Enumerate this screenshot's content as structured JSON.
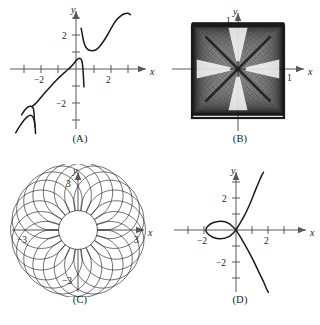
{
  "figure": {
    "background": "#ffffff",
    "ink": "#1a1a1a",
    "axis_color": "#59595b",
    "curve_color": "#1a1a1a",
    "panel_count": 4
  },
  "panels": [
    {
      "key": "A",
      "caption": "(A)",
      "axis_x_label": "x",
      "axis_y_label": "y",
      "x_tick_labels": [
        "−2",
        "2"
      ],
      "y_tick_labels": [
        "2",
        "−2"
      ],
      "chart_data": {
        "type": "line",
        "title": "",
        "subtitle": "",
        "xlabel": "x",
        "ylabel": "y",
        "xlim": [
          -3.6,
          3.4
        ],
        "ylim": [
          -3.8,
          3.4
        ],
        "x_ticks": [
          -3,
          -2,
          -1,
          1,
          2,
          3
        ],
        "y_ticks": [
          -3,
          -2,
          -1,
          1,
          2,
          3
        ],
        "x_tick_labels": {
          "-2": "−2",
          "2": "2"
        },
        "y_tick_labels": {
          "2": "2",
          "-2": "−2"
        },
        "grid": false,
        "legend": "none",
        "annotations": [
          "increasing wave-like curve with two near-vertical jump discontinuities",
          "discontinuity near x = -2.4 on the lower-left branch",
          "discontinuity near x = 0.4 spanning y from about -1 up to about 2.4"
        ],
        "series": [
          {
            "name": "branch-1-lower-left",
            "comment": "leftmost rising segment ending in a steep downward spike near x = -2.4",
            "points": [
              [
                -3.55,
                -3.75
              ],
              [
                -3.3,
                -3.35
              ],
              [
                -3.05,
                -3.0
              ],
              [
                -2.85,
                -2.8
              ],
              [
                -2.68,
                -2.72
              ],
              [
                -2.55,
                -2.8
              ],
              [
                -2.45,
                -3.05
              ],
              [
                -2.4,
                -3.45
              ],
              [
                -2.38,
                -3.8
              ]
            ]
          },
          {
            "name": "branch-2-rise-to-jump",
            "comment": "segment from the jump at x = -2.4 rising smoothly through the origin region to the jump at x = 0.4",
            "points": [
              [
                -2.42,
                -3.4
              ],
              [
                -2.45,
                -2.9
              ],
              [
                -2.48,
                -2.5
              ],
              [
                -2.52,
                -2.3
              ],
              [
                -2.62,
                -2.2
              ],
              [
                -2.8,
                -2.22
              ],
              [
                -3.0,
                -2.4
              ],
              [
                -3.2,
                -2.7
              ]
            ]
          },
          {
            "name": "branch-3-main-rise",
            "comment": "long S-shaped rise from lower-left through origin up to the discontinuity at x = 0.4",
            "points": [
              [
                -2.6,
                -2.22
              ],
              [
                -2.3,
                -1.95
              ],
              [
                -2.0,
                -1.6
              ],
              [
                -1.7,
                -1.25
              ],
              [
                -1.4,
                -0.92
              ],
              [
                -1.1,
                -0.6
              ],
              [
                -0.8,
                -0.32
              ],
              [
                -0.55,
                -0.1
              ],
              [
                -0.35,
                0.08
              ],
              [
                -0.15,
                0.3
              ],
              [
                0.0,
                0.48
              ],
              [
                0.12,
                0.6
              ],
              [
                0.25,
                0.62
              ],
              [
                0.34,
                0.5
              ],
              [
                0.4,
                0.1
              ],
              [
                0.44,
                -0.5
              ],
              [
                0.47,
                -1.05
              ]
            ]
          },
          {
            "name": "branch-4-upper-jump",
            "comment": "upper piece of the discontinuity at x = 0.4, falling from y≈2.4 then turning upward",
            "points": [
              [
                0.3,
                2.4
              ],
              [
                0.36,
                2.1
              ],
              [
                0.42,
                1.75
              ],
              [
                0.5,
                1.45
              ],
              [
                0.6,
                1.25
              ],
              [
                0.75,
                1.12
              ],
              [
                0.95,
                1.08
              ],
              [
                1.15,
                1.12
              ],
              [
                1.35,
                1.28
              ],
              [
                1.6,
                1.6
              ],
              [
                1.85,
                2.0
              ],
              [
                2.1,
                2.45
              ],
              [
                2.35,
                2.85
              ],
              [
                2.6,
                3.1
              ],
              [
                2.85,
                3.25
              ],
              [
                3.05,
                3.28
              ],
              [
                3.2,
                3.2
              ]
            ]
          }
        ]
      }
    },
    {
      "key": "B",
      "caption": "(B)",
      "axis_x_label": "x",
      "axis_y_label": "y",
      "x_tick_labels": [
        "1"
      ],
      "y_tick_labels": [
        "1"
      ],
      "chart_data": {
        "type": "line",
        "title": "",
        "subtitle": "",
        "xlabel": "x",
        "ylabel": "y",
        "xlim": [
          -1.45,
          1.45
        ],
        "ylim": [
          -1.45,
          1.45
        ],
        "x_ticks": [
          1
        ],
        "y_ticks": [
          1
        ],
        "x_tick_labels": {
          "1": "1"
        },
        "y_tick_labels": {
          "1": "1"
        },
        "grid": false,
        "legend": "none",
        "annotations": [
          "dense Lissajous-style curve filling a square region from -1 to 1 in both x and y",
          "four light bowtie-shaped voids radiating along the diagonals",
          "solid dark square border formed by the envelope of the curve"
        ],
        "series": [
          {
            "name": "lissajous-dense-mesh",
            "parametric": true,
            "x_expr": "sin(a*t)",
            "y_expr": "sin(b*t)",
            "a": 43,
            "b": 41,
            "t_range": [
              0,
              6.283185
            ],
            "samples": 2600
          }
        ]
      }
    },
    {
      "key": "C",
      "caption": "(C)",
      "axis_x_label": "x",
      "axis_y_label": "y",
      "x_tick_labels": [
        "−3",
        "3"
      ],
      "y_tick_labels": [
        "3",
        "−3"
      ],
      "chart_data": {
        "type": "line",
        "title": "",
        "subtitle": "",
        "xlabel": "x",
        "ylabel": "y",
        "xlim": [
          -4.1,
          4.1
        ],
        "ylim": [
          -4.1,
          4.1
        ],
        "x_ticks": [
          -3,
          3
        ],
        "y_ticks": [
          -3,
          3
        ],
        "x_tick_labels": {
          "-3": "−3",
          "3": "3"
        },
        "y_tick_labels": {
          "3": "3",
          "-3": "−3"
        },
        "grid": false,
        "legend": "none",
        "annotations": [
          "epitrochoid / rose-like annulus of overlapping circular petals",
          "about 22 overlapping loops arranged around an empty circular core",
          "outer radius reaches 3 on both axes"
        ],
        "series": [
          {
            "name": "epitrochoid-petals",
            "parametric": true,
            "x_expr": "(R+r)*cos(t) - d*cos((R+r)/r*t)",
            "y_expr": "(R+r)*sin(t) - d*sin((R+r)/r*t)",
            "R": 1.7,
            "r": 0.1,
            "d": 1.25,
            "petal_count": 22,
            "inner_hole_radius": 1.05,
            "outer_radius": 3.0,
            "t_range": [
              0,
              6.283185
            ],
            "samples": 2000
          }
        ]
      }
    },
    {
      "key": "D",
      "caption": "(D)",
      "axis_x_label": "x",
      "axis_y_label": "y",
      "x_tick_labels": [
        "−2",
        "2"
      ],
      "y_tick_labels": [
        "2",
        "−2"
      ],
      "chart_data": {
        "type": "line",
        "title": "",
        "subtitle": "",
        "xlabel": "x",
        "ylabel": "y",
        "xlim": [
          -3.3,
          3.6
        ],
        "ylim": [
          -3.9,
          3.6
        ],
        "x_ticks": [
          -3,
          -2,
          -1,
          1,
          2,
          3
        ],
        "y_ticks": [
          -3,
          -2,
          -1,
          1,
          2,
          3
        ],
        "x_tick_labels": {
          "-2": "−2",
          "2": "2"
        },
        "y_tick_labels": {
          "2": "2",
          "-2": "−2"
        },
        "grid": false,
        "legend": "none",
        "annotations": [
          "folium/strophoid-type curve with a small closed loop to the left of the origin",
          "loop spans roughly x = -2 to x = 0 and self-intersects at the origin",
          "upper branch rises steeply to the right, lower branch falls steeply to the right"
        ],
        "series": [
          {
            "name": "loop",
            "comment": "closed loop left of origin, node at the origin",
            "points": [
              [
                0.0,
                0.0
              ],
              [
                -0.45,
                0.42
              ],
              [
                -0.95,
                0.55
              ],
              [
                -1.45,
                0.45
              ],
              [
                -1.78,
                0.22
              ],
              [
                -1.88,
                0.0
              ],
              [
                -1.78,
                -0.22
              ],
              [
                -1.45,
                -0.45
              ],
              [
                -0.95,
                -0.55
              ],
              [
                -0.45,
                -0.42
              ],
              [
                0.0,
                0.0
              ]
            ]
          },
          {
            "name": "upper-branch",
            "comment": "branch leaving the node upward and to the right",
            "points": [
              [
                0.0,
                0.0
              ],
              [
                0.25,
                0.42
              ],
              [
                0.5,
                0.85
              ],
              [
                0.72,
                1.3
              ],
              [
                0.92,
                1.75
              ],
              [
                1.1,
                2.2
              ],
              [
                1.28,
                2.65
              ],
              [
                1.45,
                3.05
              ],
              [
                1.6,
                3.4
              ],
              [
                1.72,
                3.6
              ]
            ]
          },
          {
            "name": "lower-branch",
            "comment": "branch leaving the node downward and to the right",
            "points": [
              [
                0.0,
                0.0
              ],
              [
                0.28,
                -0.45
              ],
              [
                0.55,
                -0.92
              ],
              [
                0.82,
                -1.4
              ],
              [
                1.08,
                -1.9
              ],
              [
                1.32,
                -2.4
              ],
              [
                1.55,
                -2.88
              ],
              [
                1.75,
                -3.3
              ],
              [
                1.92,
                -3.7
              ],
              [
                2.02,
                -3.9
              ]
            ]
          }
        ]
      }
    }
  ]
}
